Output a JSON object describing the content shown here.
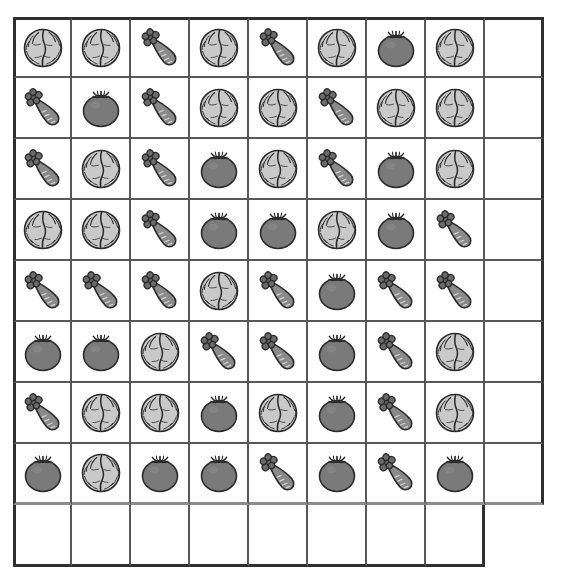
{
  "header": {
    "left_text": "",
    "right_text": ""
  },
  "worksheet": {
    "title": "",
    "columns": 9,
    "rows": 9,
    "icon_legend": {
      "cabbage": "cabbage-icon",
      "carrot": "carrot-icon",
      "tomato": "tomato-icon",
      "empty": "empty-cell"
    },
    "colors": {
      "grid_line": "#585858",
      "grid_frame": "#2f2f2f",
      "cabbage_fill": "#c9c9c9",
      "carrot_fill": "#8a8a8a",
      "tomato_fill": "#7a7a7a",
      "leaf_fill": "#6b6b6b",
      "outline": "#2b2b2b",
      "background": "#ffffff"
    },
    "grid": [
      [
        "cabbage",
        "cabbage",
        "carrot",
        "cabbage",
        "carrot",
        "cabbage",
        "tomato",
        "cabbage",
        "empty"
      ],
      [
        "carrot",
        "tomato",
        "carrot",
        "cabbage",
        "cabbage",
        "carrot",
        "cabbage",
        "cabbage",
        "empty"
      ],
      [
        "carrot",
        "cabbage",
        "carrot",
        "tomato",
        "cabbage",
        "carrot",
        "tomato",
        "cabbage",
        "empty"
      ],
      [
        "cabbage",
        "cabbage",
        "carrot",
        "tomato",
        "tomato",
        "cabbage",
        "tomato",
        "carrot",
        "empty"
      ],
      [
        "carrot",
        "carrot",
        "carrot",
        "cabbage",
        "carrot",
        "tomato",
        "carrot",
        "carrot",
        "empty"
      ],
      [
        "tomato",
        "tomato",
        "cabbage",
        "carrot",
        "carrot",
        "tomato",
        "carrot",
        "cabbage",
        "empty"
      ],
      [
        "carrot",
        "cabbage",
        "cabbage",
        "tomato",
        "cabbage",
        "tomato",
        "carrot",
        "cabbage",
        "empty"
      ],
      [
        "tomato",
        "cabbage",
        "tomato",
        "tomato",
        "carrot",
        "tomato",
        "carrot",
        "tomato",
        "empty"
      ],
      [
        "empty",
        "empty",
        "empty",
        "empty",
        "empty",
        "empty",
        "empty",
        "empty"
      ]
    ],
    "counts": {
      "cabbage": 24,
      "carrot": 22,
      "tomato": 18
    }
  }
}
